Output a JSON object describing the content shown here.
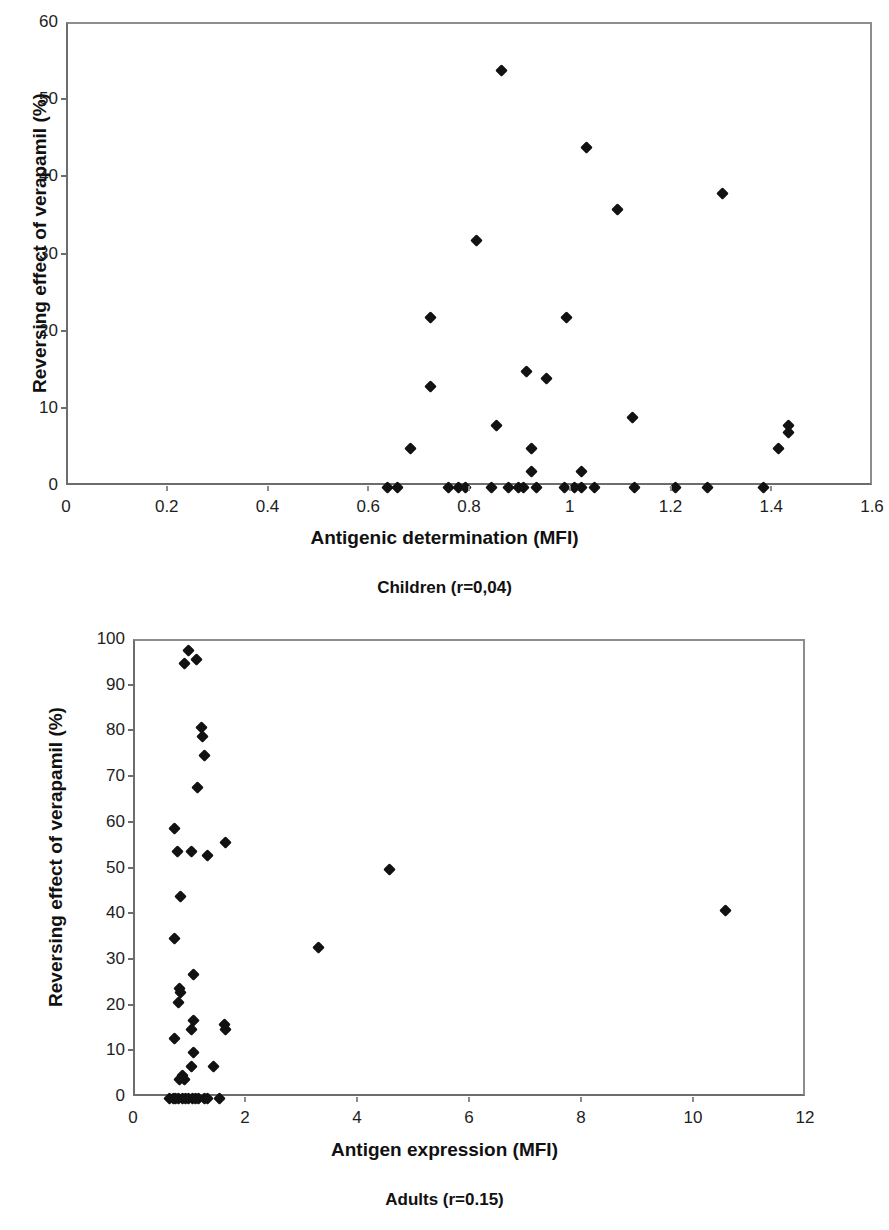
{
  "figure": {
    "background": "#ffffff",
    "marker_color": "#121212",
    "axis_color": "#6d6d6d"
  },
  "charts": [
    {
      "id": "children",
      "caption": "Children (r=0,04)",
      "xlabel": "Antigenic determination (MFI)",
      "ylabel": "Reversing effect of verapamil (%)",
      "xticks": [
        "0",
        "0.2",
        "0.4",
        "0.6",
        "0.8",
        "1",
        "1.2",
        "1.4",
        "1.6"
      ],
      "yticks": [
        "0",
        "10",
        "20",
        "30",
        "40",
        "50",
        "60"
      ]
    },
    {
      "id": "adults",
      "caption": "Adults (r=0.15)",
      "xlabel": "Antigen expression (MFI)",
      "ylabel": "Reversing effect of verapamil (%)",
      "xticks": [
        "0",
        "2",
        "4",
        "6",
        "8",
        "10",
        "12"
      ],
      "yticks": [
        "0",
        "10",
        "20",
        "30",
        "40",
        "50",
        "60",
        "70",
        "80",
        "90",
        "100"
      ]
    }
  ],
  "chart_data": [
    {
      "type": "scatter",
      "id": "children",
      "title": "Children (r=0,04)",
      "xlabel": "Antigenic determination (MFI)",
      "ylabel": "Reversing effect of verapamil (%)",
      "xlim": [
        0,
        1.6
      ],
      "ylim": [
        0,
        60
      ],
      "xtick_values": [
        0,
        0.2,
        0.4,
        0.6,
        0.8,
        1,
        1.2,
        1.4,
        1.6
      ],
      "ytick_values": [
        0,
        10,
        20,
        30,
        40,
        50,
        60
      ],
      "grid": false,
      "legend": "none",
      "correlation_label": "r=0,04",
      "series": [
        {
          "name": "Children",
          "marker": "diamond",
          "color": "#121212",
          "points": [
            [
              0.86,
              54
            ],
            [
              1.03,
              44
            ],
            [
              1.3,
              38
            ],
            [
              1.09,
              36
            ],
            [
              0.81,
              32
            ],
            [
              0.72,
              22
            ],
            [
              0.99,
              22
            ],
            [
              0.91,
              15
            ],
            [
              0.95,
              14
            ],
            [
              0.72,
              13
            ],
            [
              1.12,
              9
            ],
            [
              1.43,
              8
            ],
            [
              0.85,
              8
            ],
            [
              1.43,
              7
            ],
            [
              0.68,
              5
            ],
            [
              0.92,
              5
            ],
            [
              1.41,
              5
            ],
            [
              0.92,
              2
            ],
            [
              1.02,
              2
            ],
            [
              0.635,
              0
            ],
            [
              0.655,
              0
            ],
            [
              0.755,
              0
            ],
            [
              0.775,
              0
            ],
            [
              0.79,
              0
            ],
            [
              0.84,
              0
            ],
            [
              0.875,
              0
            ],
            [
              0.895,
              0
            ],
            [
              0.905,
              0
            ],
            [
              0.93,
              0
            ],
            [
              0.985,
              0
            ],
            [
              1.005,
              0
            ],
            [
              1.02,
              0
            ],
            [
              1.045,
              0
            ],
            [
              1.125,
              0
            ],
            [
              1.205,
              0
            ],
            [
              1.27,
              0
            ],
            [
              1.38,
              0
            ]
          ]
        }
      ]
    },
    {
      "type": "scatter",
      "id": "adults",
      "title": "Adults (r=0.15)",
      "xlabel": "Antigen expression (MFI)",
      "ylabel": "Reversing effect of verapamil (%)",
      "xlim": [
        0,
        12
      ],
      "ylim": [
        0,
        100
      ],
      "xtick_values": [
        0,
        2,
        4,
        6,
        8,
        10,
        12
      ],
      "ytick_values": [
        0,
        10,
        20,
        30,
        40,
        50,
        60,
        70,
        80,
        90,
        100
      ],
      "grid": false,
      "legend": "none",
      "correlation_label": "r=0.15",
      "series": [
        {
          "name": "Adults",
          "marker": "diamond",
          "color": "#121212",
          "points": [
            [
              0.95,
              98
            ],
            [
              1.1,
              96
            ],
            [
              0.88,
              95
            ],
            [
              1.18,
              81
            ],
            [
              1.2,
              79
            ],
            [
              1.24,
              75
            ],
            [
              1.12,
              68
            ],
            [
              0.7,
              59
            ],
            [
              1.62,
              56
            ],
            [
              0.75,
              54
            ],
            [
              1.0,
              54
            ],
            [
              1.3,
              53
            ],
            [
              4.55,
              50
            ],
            [
              0.82,
              44
            ],
            [
              10.55,
              41
            ],
            [
              0.7,
              35
            ],
            [
              3.28,
              33
            ],
            [
              1.05,
              27
            ],
            [
              0.8,
              24
            ],
            [
              0.82,
              23
            ],
            [
              0.78,
              21
            ],
            [
              1.6,
              16
            ],
            [
              1.05,
              17
            ],
            [
              1.62,
              15
            ],
            [
              1.0,
              15
            ],
            [
              0.7,
              13
            ],
            [
              1.05,
              10
            ],
            [
              1.0,
              7
            ],
            [
              1.4,
              7
            ],
            [
              0.84,
              5
            ],
            [
              0.88,
              4
            ],
            [
              0.8,
              4
            ],
            [
              0.62,
              0
            ],
            [
              0.68,
              0
            ],
            [
              0.72,
              0
            ],
            [
              0.78,
              0
            ],
            [
              0.84,
              0
            ],
            [
              0.9,
              0
            ],
            [
              0.96,
              0
            ],
            [
              1.02,
              0
            ],
            [
              1.08,
              0
            ],
            [
              1.14,
              0
            ],
            [
              1.24,
              0
            ],
            [
              1.3,
              0
            ],
            [
              1.5,
              0
            ]
          ]
        }
      ]
    }
  ]
}
